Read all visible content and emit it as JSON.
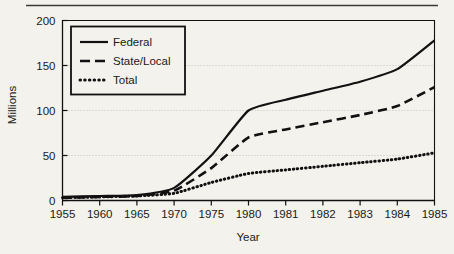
{
  "figure": {
    "background_color": "#f4f2ed",
    "ink_color": "#111111",
    "grid_color": "#b9b9b9",
    "top_rule": true
  },
  "chart_data": {
    "type": "line",
    "title": "",
    "subtitle": "",
    "xlabel": "Year",
    "ylabel": "Millions",
    "x": [
      1955,
      1960,
      1965,
      1970,
      1975,
      1980,
      1981,
      1982,
      1983,
      1984,
      1985
    ],
    "categories": [
      "1955",
      "1960",
      "1965",
      "1970",
      "1975",
      "1980",
      "1981",
      "1982",
      "1983",
      "1984",
      "1985"
    ],
    "xtick_labels": [
      "1955",
      "1960",
      "1965",
      "1970",
      "1975",
      "1980",
      "1981",
      "1982",
      "1983",
      "1984",
      "1985"
    ],
    "ytick_labels": [
      "0",
      "50",
      "100",
      "150",
      "200"
    ],
    "yticks": [
      0,
      50,
      100,
      150,
      200
    ],
    "ylim": [
      0,
      200
    ],
    "xlim_categorical": true,
    "grid": "horizontal-dotted",
    "grid_levels": [
      50,
      100,
      150
    ],
    "legend_position": "upper-left",
    "series": [
      {
        "name": "Federal",
        "style": "solid",
        "values": [
          4,
          5,
          6,
          14,
          50,
          100,
          112,
          122,
          132,
          146,
          178
        ]
      },
      {
        "name": "State/Local",
        "style": "dashed",
        "values": [
          3,
          4,
          5,
          11,
          36,
          70,
          79,
          87,
          95,
          105,
          126
        ]
      },
      {
        "name": "Total",
        "style": "dotted",
        "values": [
          3,
          4,
          5,
          8,
          20,
          30,
          34,
          38,
          42,
          46,
          53
        ]
      }
    ]
  },
  "legend": {
    "items": [
      {
        "label": "Federal",
        "style": "solid"
      },
      {
        "label": "State/Local",
        "style": "dashed"
      },
      {
        "label": "Total",
        "style": "dotted"
      }
    ]
  },
  "axes": {
    "x_title": "Year",
    "y_title": "Millions"
  }
}
